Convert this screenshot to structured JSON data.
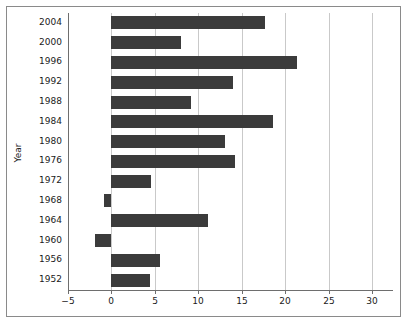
{
  "figure": {
    "axis_labels": {
      "ylabel": "Year",
      "xlabel": ""
    }
  },
  "chart_data": {
    "type": "bar",
    "orientation": "horizontal",
    "title": "",
    "xlabel": "",
    "ylabel": "Year",
    "categories": [
      "1952",
      "1956",
      "1960",
      "1964",
      "1968",
      "1972",
      "1976",
      "1980",
      "1984",
      "1988",
      "1992",
      "1996",
      "2000",
      "2004"
    ],
    "values": [
      4.4,
      5.6,
      -1.9,
      11.1,
      -0.8,
      4.6,
      14.2,
      13.1,
      18.6,
      9.2,
      14.0,
      21.4,
      8.0,
      17.7
    ],
    "xlim": [
      -5,
      31.5
    ],
    "xticks": [
      -5,
      0,
      5,
      10,
      15,
      20,
      25,
      30
    ],
    "xticklabels": [
      "−5",
      "0",
      "5",
      "10",
      "15",
      "20",
      "25",
      "30"
    ],
    "grid": "vertical",
    "legend": null,
    "bar_color": "#3b3b3b",
    "grid_color": "#c9c9c9",
    "axis_color": "#6e6e6e"
  }
}
